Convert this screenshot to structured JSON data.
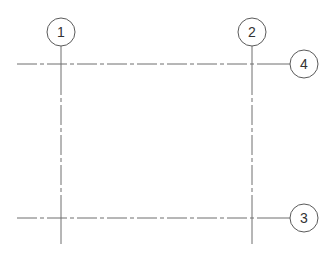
{
  "diagram": {
    "type": "structural-grid-plan",
    "colors": {
      "line": "#6e6e6e",
      "bubble_stroke": "#5a5a5a",
      "label": "#333333",
      "background": "#ffffff"
    },
    "vertical_grids": [
      {
        "label": "1",
        "x": 61,
        "bubble_cy": 32
      },
      {
        "label": "2",
        "x": 252,
        "bubble_cy": 32
      }
    ],
    "horizontal_grids": [
      {
        "label": "4",
        "y": 64,
        "bubble_cx": 304
      },
      {
        "label": "3",
        "y": 218,
        "bubble_cx": 304
      }
    ]
  }
}
